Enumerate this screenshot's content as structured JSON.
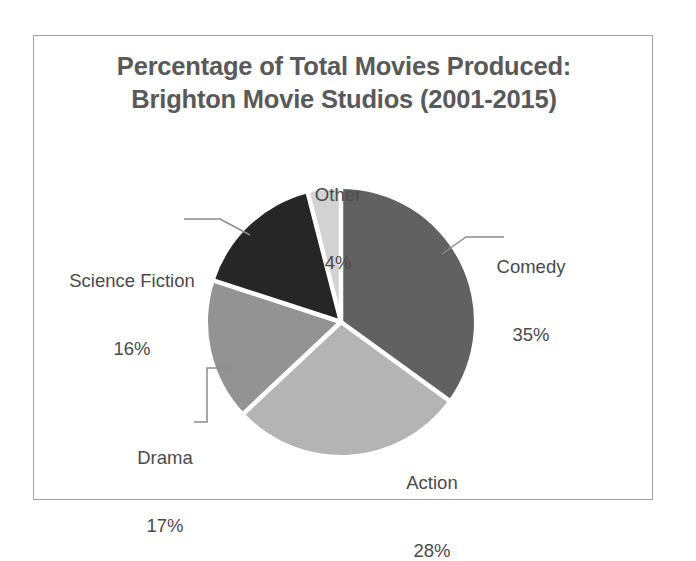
{
  "chart_data": {
    "type": "pie",
    "title": "Percentage of Total Movies Produced: Brighton Movie Studios (2001-2015)",
    "title_line1": "Percentage of Total Movies Produced:",
    "title_line2": "Brighton Movie Studios (2001-2015)",
    "xlabel": "",
    "ylabel": "",
    "units": "percent",
    "legend_position": "none",
    "labels_outside": true,
    "start_angle_deg": 0,
    "direction": "clockwise",
    "categories": [
      "Comedy",
      "Action",
      "Drama",
      "Science Fiction",
      "Other"
    ],
    "values": [
      35,
      28,
      17,
      16,
      4
    ],
    "slices": [
      {
        "name": "Comedy",
        "value": 35,
        "value_text": "35%",
        "color": "#616161"
      },
      {
        "name": "Action",
        "value": 28,
        "value_text": "28%",
        "color": "#b4b4b4"
      },
      {
        "name": "Drama",
        "value": 17,
        "value_text": "17%",
        "color": "#939393"
      },
      {
        "name": "Science Fiction",
        "value": 16,
        "value_text": "16%",
        "color": "#262626"
      },
      {
        "name": "Other",
        "value": 4,
        "value_text": "4%",
        "color": "#d2d2d2"
      }
    ],
    "total": 100,
    "separator_color": "#ffffff",
    "leader_line_color": "#8c8c8c"
  },
  "frame": {
    "border_color": "#a3a3a3",
    "background": "#ffffff"
  },
  "text": {
    "title_color": "#595959",
    "label_color": "#4a4a4a"
  }
}
